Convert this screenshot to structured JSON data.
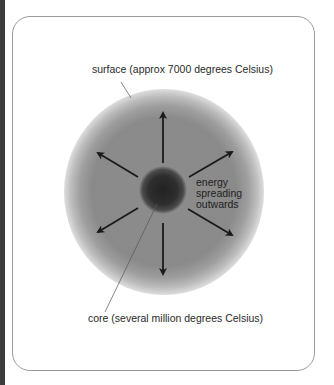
{
  "diagram": {
    "labels": {
      "surface": "surface (approx 7000 degrees Celsius)",
      "core": "core (several million degrees Celsius)",
      "energy_lines": [
        "energy",
        "spreading",
        "outwards"
      ]
    },
    "arrows": {
      "count": 6,
      "directions": [
        "up",
        "down",
        "upper-left",
        "upper-right",
        "lower-left",
        "lower-right"
      ]
    },
    "colors": {
      "sphere_body": "#8a8a8a",
      "sphere_edge": "#d8d8d8",
      "core": "#2a2a2a",
      "arrow": "#1a1a1a",
      "leader_line": "#555555",
      "card_border": "#9a9a9a",
      "left_strip": "#3c3c3c"
    }
  }
}
